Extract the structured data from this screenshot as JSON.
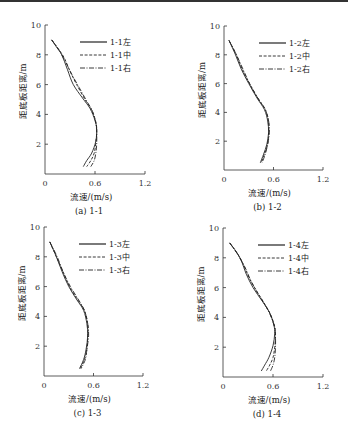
{
  "figure": {
    "panels_layout": "2x2"
  },
  "chart_data": [
    {
      "id": "a",
      "type": "line",
      "caption": "(a) 1-1",
      "xlabel": "流速/(m/s)",
      "ylabel": "距底板距离/m",
      "xlim": [
        0,
        1.2
      ],
      "ylim": [
        0,
        10
      ],
      "xticks": [
        "0",
        "0.6",
        "1.2"
      ],
      "yticks": [
        "2",
        "4",
        "6",
        "8",
        "10"
      ],
      "grid": false,
      "legend_position": "upper right",
      "series": [
        {
          "name": "1-1左",
          "style": "solid",
          "points": [
            [
              0.08,
              9.0
            ],
            [
              0.14,
              8.5
            ],
            [
              0.2,
              8.0
            ],
            [
              0.27,
              7.0
            ],
            [
              0.34,
              6.0
            ],
            [
              0.45,
              5.1
            ],
            [
              0.54,
              4.4
            ],
            [
              0.6,
              3.6
            ],
            [
              0.62,
              3.0
            ],
            [
              0.61,
              2.2
            ],
            [
              0.56,
              1.4
            ],
            [
              0.5,
              0.9
            ],
            [
              0.46,
              0.5
            ]
          ]
        },
        {
          "name": "1-1中",
          "style": "dashed",
          "points": [
            [
              0.08,
              9.0
            ],
            [
              0.16,
              8.4
            ],
            [
              0.23,
              7.8
            ],
            [
              0.3,
              6.9
            ],
            [
              0.38,
              6.0
            ],
            [
              0.48,
              5.0
            ],
            [
              0.56,
              4.3
            ],
            [
              0.61,
              3.5
            ],
            [
              0.62,
              2.9
            ],
            [
              0.61,
              2.1
            ],
            [
              0.59,
              1.4
            ],
            [
              0.55,
              0.9
            ],
            [
              0.5,
              0.5
            ]
          ]
        },
        {
          "name": "1-1右",
          "style": "dashdot",
          "points": [
            [
              0.08,
              9.0
            ],
            [
              0.17,
              8.3
            ],
            [
              0.24,
              7.6
            ],
            [
              0.32,
              6.7
            ],
            [
              0.41,
              5.8
            ],
            [
              0.5,
              4.9
            ],
            [
              0.57,
              4.2
            ],
            [
              0.61,
              3.4
            ],
            [
              0.62,
              2.8
            ],
            [
              0.62,
              2.0
            ],
            [
              0.61,
              1.4
            ],
            [
              0.59,
              0.9
            ],
            [
              0.55,
              0.5
            ]
          ]
        }
      ]
    },
    {
      "id": "b",
      "type": "line",
      "caption": "(b) 1-2",
      "xlabel": "流速/(m/s)",
      "ylabel": "距底板距离/m",
      "xlim": [
        0,
        1.2
      ],
      "ylim": [
        0,
        10
      ],
      "xticks": [
        "0",
        "0.6",
        "1.2"
      ],
      "yticks": [
        "2",
        "4",
        "6",
        "8",
        "10"
      ],
      "grid": false,
      "legend_position": "upper right",
      "series": [
        {
          "name": "1-2左",
          "style": "solid",
          "points": [
            [
              0.06,
              9.0
            ],
            [
              0.14,
              8.0
            ],
            [
              0.21,
              7.0
            ],
            [
              0.3,
              6.0
            ],
            [
              0.4,
              5.0
            ],
            [
              0.49,
              4.2
            ],
            [
              0.53,
              3.4
            ],
            [
              0.54,
              2.6
            ],
            [
              0.52,
              1.8
            ],
            [
              0.48,
              1.1
            ],
            [
              0.44,
              0.5
            ]
          ]
        },
        {
          "name": "1-2中",
          "style": "dashed",
          "points": [
            [
              0.06,
              9.0
            ],
            [
              0.15,
              8.0
            ],
            [
              0.22,
              7.0
            ],
            [
              0.31,
              6.0
            ],
            [
              0.41,
              5.0
            ],
            [
              0.5,
              4.2
            ],
            [
              0.54,
              3.4
            ],
            [
              0.54,
              2.6
            ],
            [
              0.53,
              1.8
            ],
            [
              0.49,
              1.1
            ],
            [
              0.45,
              0.5
            ]
          ]
        },
        {
          "name": "1-2右",
          "style": "dashdot",
          "points": [
            [
              0.06,
              9.0
            ],
            [
              0.15,
              8.0
            ],
            [
              0.23,
              7.0
            ],
            [
              0.31,
              6.0
            ],
            [
              0.41,
              5.0
            ],
            [
              0.5,
              4.2
            ],
            [
              0.54,
              3.4
            ],
            [
              0.55,
              2.6
            ],
            [
              0.53,
              1.8
            ],
            [
              0.5,
              1.1
            ],
            [
              0.46,
              0.5
            ]
          ]
        }
      ]
    },
    {
      "id": "c",
      "type": "line",
      "caption": "(c) 1-3",
      "xlabel": "流速/(m/s)",
      "ylabel": "距底板距离/m",
      "xlim": [
        0,
        1.2
      ],
      "ylim": [
        0,
        10
      ],
      "xticks": [
        "0",
        "0.6",
        "1.2"
      ],
      "yticks": [
        "2",
        "4",
        "6",
        "8",
        "10"
      ],
      "grid": false,
      "legend_position": "upper right",
      "series": [
        {
          "name": "1-3左",
          "style": "solid",
          "points": [
            [
              0.07,
              9.0
            ],
            [
              0.15,
              8.0
            ],
            [
              0.22,
              7.0
            ],
            [
              0.3,
              6.0
            ],
            [
              0.4,
              5.1
            ],
            [
              0.48,
              4.4
            ],
            [
              0.52,
              3.5
            ],
            [
              0.53,
              2.7
            ],
            [
              0.51,
              1.8
            ],
            [
              0.48,
              1.1
            ],
            [
              0.43,
              0.5
            ]
          ]
        },
        {
          "name": "1-3中",
          "style": "dashed",
          "points": [
            [
              0.07,
              9.0
            ],
            [
              0.15,
              8.0
            ],
            [
              0.23,
              7.0
            ],
            [
              0.31,
              6.0
            ],
            [
              0.41,
              5.1
            ],
            [
              0.49,
              4.4
            ],
            [
              0.53,
              3.5
            ],
            [
              0.53,
              2.7
            ],
            [
              0.52,
              1.8
            ],
            [
              0.49,
              1.1
            ],
            [
              0.44,
              0.5
            ]
          ]
        },
        {
          "name": "1-3右",
          "style": "dashdot",
          "points": [
            [
              0.07,
              9.0
            ],
            [
              0.16,
              8.0
            ],
            [
              0.23,
              7.0
            ],
            [
              0.32,
              6.0
            ],
            [
              0.42,
              5.1
            ],
            [
              0.49,
              4.4
            ],
            [
              0.53,
              3.5
            ],
            [
              0.54,
              2.7
            ],
            [
              0.52,
              1.8
            ],
            [
              0.5,
              1.1
            ],
            [
              0.45,
              0.5
            ]
          ]
        }
      ]
    },
    {
      "id": "d",
      "type": "line",
      "caption": "(d) 1-4",
      "xlabel": "流速/(m/s)",
      "ylabel": "距底板距离/m",
      "xlim": [
        0,
        1.2
      ],
      "ylim": [
        0,
        10
      ],
      "xticks": [
        "0",
        "0.6",
        "1.2"
      ],
      "yticks": [
        "2",
        "4",
        "6",
        "8",
        "10"
      ],
      "grid": false,
      "legend_position": "upper right",
      "series": [
        {
          "name": "1-4左",
          "style": "solid",
          "points": [
            [
              0.08,
              9.0
            ],
            [
              0.16,
              8.4
            ],
            [
              0.22,
              7.8
            ],
            [
              0.28,
              6.9
            ],
            [
              0.36,
              6.0
            ],
            [
              0.47,
              5.1
            ],
            [
              0.56,
              4.3
            ],
            [
              0.61,
              3.5
            ],
            [
              0.62,
              2.9
            ],
            [
              0.6,
              2.1
            ],
            [
              0.55,
              1.3
            ],
            [
              0.5,
              0.8
            ],
            [
              0.46,
              0.4
            ]
          ]
        },
        {
          "name": "1-4中",
          "style": "dashed",
          "points": [
            [
              0.08,
              9.0
            ],
            [
              0.17,
              8.3
            ],
            [
              0.24,
              7.6
            ],
            [
              0.31,
              6.7
            ],
            [
              0.39,
              5.9
            ],
            [
              0.49,
              5.0
            ],
            [
              0.57,
              4.2
            ],
            [
              0.62,
              3.4
            ],
            [
              0.63,
              2.8
            ],
            [
              0.62,
              2.0
            ],
            [
              0.6,
              1.3
            ],
            [
              0.56,
              0.8
            ],
            [
              0.52,
              0.4
            ]
          ]
        },
        {
          "name": "1-4右",
          "style": "dashdot",
          "points": [
            [
              0.08,
              9.0
            ],
            [
              0.18,
              8.2
            ],
            [
              0.26,
              7.4
            ],
            [
              0.34,
              6.4
            ],
            [
              0.43,
              5.5
            ],
            [
              0.52,
              4.7
            ],
            [
              0.58,
              4.0
            ],
            [
              0.62,
              3.3
            ],
            [
              0.63,
              2.7
            ],
            [
              0.63,
              2.0
            ],
            [
              0.62,
              1.3
            ],
            [
              0.6,
              0.8
            ],
            [
              0.57,
              0.4
            ]
          ]
        }
      ]
    }
  ]
}
